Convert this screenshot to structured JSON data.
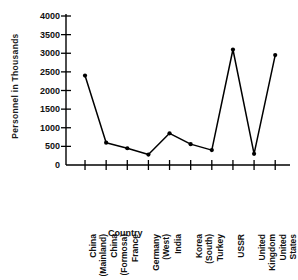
{
  "chart_data": {
    "type": "line",
    "title": "",
    "xlabel": "Country",
    "ylabel": "Personnel  in  Thousands",
    "categories": [
      "China\n(Mainland)",
      "China\n(Formosa)",
      "France",
      "Germany\n(West)",
      "India",
      "Korea\n(South)",
      "Turkey",
      "USSR",
      "United\nKingdom",
      "United\nStates"
    ],
    "values": [
      2400,
      600,
      450,
      280,
      850,
      560,
      400,
      3100,
      300,
      2950
    ],
    "ylim": [
      0,
      4000
    ],
    "yticks": [
      0,
      500,
      1000,
      1500,
      2000,
      2500,
      3000,
      3500,
      4000
    ],
    "ytick_labels": [
      "0",
      "500",
      "1000",
      "1500",
      "2000",
      "2500",
      "3000",
      "3500",
      "4000"
    ],
    "grid": false,
    "legend": null,
    "marker": "filled-circle",
    "line_color": "#000000",
    "marker_color": "#000000",
    "axis_color": "#000000"
  }
}
